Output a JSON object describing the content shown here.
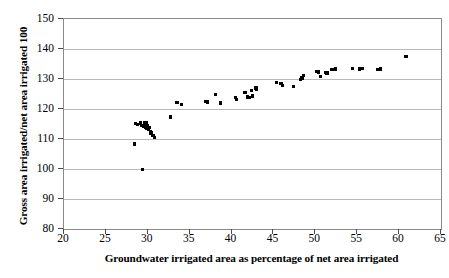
{
  "chart_data": {
    "type": "scatter",
    "title": "",
    "xlabel": "Groundwater irrigated area as percentage of net area irrigated",
    "ylabel": "Gross area irrigated/net area irrigated 100",
    "xlim": [
      20,
      65
    ],
    "ylim": [
      80,
      150
    ],
    "xticks": [
      20,
      25,
      30,
      35,
      40,
      45,
      50,
      55,
      60,
      65
    ],
    "yticks": [
      80,
      90,
      100,
      110,
      120,
      130,
      140,
      150
    ],
    "grid": "horizontal",
    "legend": "none",
    "marker": "square",
    "marker_color": "#000000",
    "series": [
      {
        "name": "observations",
        "points": [
          [
            28.4,
            108.3
          ],
          [
            28.5,
            115.2
          ],
          [
            28.8,
            114.8
          ],
          [
            29.1,
            115.4
          ],
          [
            29.3,
            114.6
          ],
          [
            29.4,
            99.8
          ],
          [
            29.5,
            114.2
          ],
          [
            29.6,
            115.3
          ],
          [
            29.7,
            114.0
          ],
          [
            29.8,
            115.6
          ],
          [
            29.9,
            113.6
          ],
          [
            30.0,
            114.4
          ],
          [
            30.1,
            113.2
          ],
          [
            30.2,
            113.8
          ],
          [
            30.3,
            112.6
          ],
          [
            30.4,
            112.0
          ],
          [
            30.6,
            111.2
          ],
          [
            30.8,
            110.5
          ],
          [
            32.7,
            117.4
          ],
          [
            33.4,
            122.2
          ],
          [
            33.5,
            122.1
          ],
          [
            34.0,
            121.6
          ],
          [
            36.9,
            122.5
          ],
          [
            37.1,
            122.4
          ],
          [
            38.1,
            124.8
          ],
          [
            38.7,
            122.0
          ],
          [
            40.5,
            123.8
          ],
          [
            40.6,
            123.2
          ],
          [
            41.6,
            125.6
          ],
          [
            41.9,
            124.0
          ],
          [
            42.1,
            123.8
          ],
          [
            42.4,
            126.2
          ],
          [
            42.5,
            124.3
          ],
          [
            42.9,
            127.0
          ],
          [
            43.0,
            126.6
          ],
          [
            45.4,
            128.8
          ],
          [
            45.9,
            128.6
          ],
          [
            46.1,
            127.9
          ],
          [
            47.4,
            127.6
          ],
          [
            48.2,
            129.9
          ],
          [
            48.4,
            130.3
          ],
          [
            48.6,
            131.1
          ],
          [
            50.2,
            132.5
          ],
          [
            50.4,
            132.4
          ],
          [
            50.6,
            130.9
          ],
          [
            51.2,
            132.2
          ],
          [
            51.4,
            132.0
          ],
          [
            51.9,
            133.1
          ],
          [
            52.1,
            133.2
          ],
          [
            52.4,
            133.3
          ],
          [
            54.4,
            133.5
          ],
          [
            55.3,
            133.4
          ],
          [
            55.6,
            133.5
          ],
          [
            57.5,
            133.2
          ],
          [
            57.8,
            133.3
          ],
          [
            60.8,
            137.6
          ]
        ]
      }
    ]
  }
}
